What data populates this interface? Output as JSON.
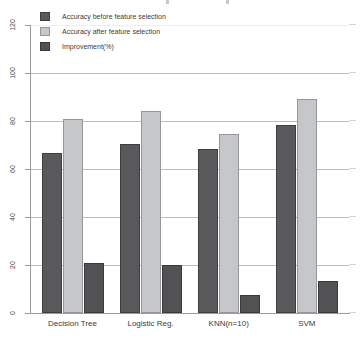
{
  "chart_data": {
    "type": "bar",
    "title": "",
    "categories": [
      "Decision Tree",
      "Logistic Reg.",
      "KNN(n=10)",
      "SVM"
    ],
    "series": [
      {
        "name": "Accuracy before feature selection",
        "color": "#59595b",
        "border": "#3f3f41",
        "values": [
          66.5,
          70.5,
          68.5,
          78.5
        ]
      },
      {
        "name": "Accuracy after feature selection",
        "color": "#c6c7c9",
        "border": "#96969a",
        "values": [
          81,
          84,
          74.5,
          89
        ]
      },
      {
        "name": "Improvement(%)",
        "color": "#525254",
        "border": "#3a3a3c",
        "values": [
          21,
          20,
          7.5,
          13.5
        ]
      }
    ],
    "xlabel": "",
    "ylabel": "",
    "ylim": [
      0,
      120
    ],
    "yticks": [
      0,
      20,
      40,
      60,
      80,
      100,
      120
    ],
    "grid": true,
    "grid_color": "#bdbdbd",
    "axis_color": "#9c9c9c",
    "legend_position": "upper-left",
    "background": "#ffffff"
  }
}
